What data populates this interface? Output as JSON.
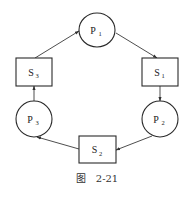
{
  "diagram": {
    "type": "cycle",
    "processes": [
      {
        "id": "P1",
        "label": "P",
        "sub": "1",
        "cx": 97,
        "cy": 30,
        "rx": 18,
        "ry": 17
      },
      {
        "id": "P2",
        "label": "P",
        "sub": "2",
        "cx": 160,
        "cy": 119,
        "rx": 18,
        "ry": 18
      },
      {
        "id": "P3",
        "label": "P",
        "sub": "3",
        "cx": 34,
        "cy": 119,
        "rx": 18,
        "ry": 18
      }
    ],
    "semaphores": [
      {
        "id": "S1",
        "label": "S",
        "sub": "1",
        "x": 142,
        "y": 58,
        "w": 36,
        "h": 28
      },
      {
        "id": "S2",
        "label": "S",
        "sub": "2",
        "x": 79,
        "y": 136,
        "w": 37,
        "h": 27
      },
      {
        "id": "S3",
        "label": "S",
        "sub": "3",
        "x": 16,
        "y": 58,
        "w": 36,
        "h": 28
      }
    ],
    "edges": [
      {
        "from": "P1",
        "to": "S1"
      },
      {
        "from": "S1",
        "to": "P2"
      },
      {
        "from": "P2",
        "to": "S2"
      },
      {
        "from": "S2",
        "to": "P3"
      },
      {
        "from": "P3",
        "to": "S3"
      },
      {
        "from": "S3",
        "to": "P1"
      }
    ]
  },
  "caption": {
    "prefix": "图",
    "number": "2-21"
  }
}
